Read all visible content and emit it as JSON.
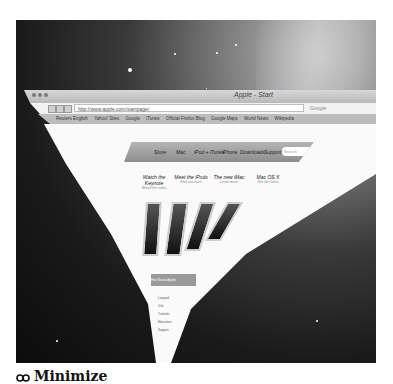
{
  "window": {
    "title": "Apple - Start",
    "url": "http://www.apple.com/startpage/",
    "search_placeholder": "Google",
    "bookmarks": [
      "Reuters English",
      "Yahoo! Sites",
      "Google",
      "iTunes",
      "Official Firefox Blog",
      "Google Maps",
      "World News",
      "Wikipedia"
    ]
  },
  "apple_nav": {
    "items": [
      "Store",
      "Mac",
      "iPod + iTunes",
      "iPhone",
      "Downloads",
      "Support"
    ],
    "search_placeholder": "Search"
  },
  "promos": [
    {
      "title": "Watch the Keynote",
      "sub": "Watch the video"
    },
    {
      "title": "Meet the iPods",
      "sub": "Find out more"
    },
    {
      "title": "The new iMac",
      "sub": "Learn more"
    },
    {
      "title": "Mac OS X",
      "sub": "Get the latest"
    }
  ],
  "tabs_strip": [
    "Hot News",
    "Apple",
    "Downloads",
    "Support"
  ],
  "list_items": [
    "Leopard",
    "iLife",
    "Tutorials",
    "Education",
    "Support"
  ],
  "caption": {
    "icon": "genie-effect-icon",
    "label": "Minimize"
  }
}
